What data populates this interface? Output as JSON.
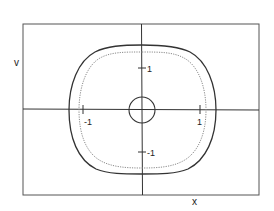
{
  "diagram": {
    "type": "phase-portrait",
    "axis_labels": {
      "vertical": "v",
      "horizontal": "x"
    },
    "ticks": {
      "x_neg": "-1",
      "x_pos": "1",
      "y_pos": "1",
      "y_neg": "-1"
    },
    "curves": [
      {
        "name": "outer-closed-orbit",
        "style": "solid",
        "color": "#333333"
      },
      {
        "name": "inner-closed-orbit",
        "style": "dotted",
        "color": "#888888"
      },
      {
        "name": "small-circle-at-origin",
        "style": "solid",
        "color": "#333333"
      }
    ],
    "colors": {
      "frame": "#444444",
      "axes": "#333333",
      "outer": "#333333",
      "inner": "#8a8a8a",
      "text": "#222222"
    }
  }
}
